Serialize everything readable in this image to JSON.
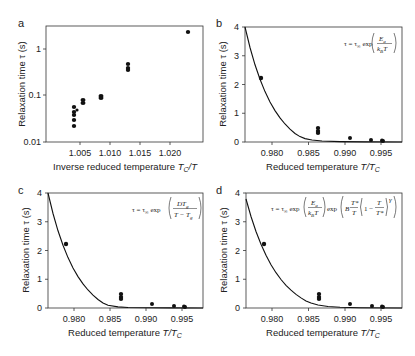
{
  "chart_data": [
    {
      "panel": "a",
      "type": "scatter",
      "title": "",
      "xlabel": "Inverse reduced temperature T_C/T",
      "ylabel": "Relaxation time τ (s)",
      "xscale": "linear",
      "yscale": "log",
      "xlim": [
        1.0017,
        1.0238
      ],
      "ylim": [
        0.01,
        3.2
      ],
      "xticks": [
        "1.005",
        "1.010",
        "1.015",
        "1.020"
      ],
      "yticks": [
        "0.01",
        "0.1",
        "1"
      ],
      "grid": false,
      "series": [
        {
          "name": "data",
          "x": [
            1.0047,
            1.0047,
            1.0047,
            1.0047,
            1.0047,
            1.0062,
            1.0062,
            1.0093,
            1.0093,
            1.0137,
            1.0137,
            1.0137,
            1.022
          ],
          "y": [
            0.055,
            0.043,
            0.037,
            0.029,
            0.022,
            0.078,
            0.07,
            0.15,
            0.14,
            0.47,
            0.38,
            0.35,
            2.3
          ]
        }
      ]
    },
    {
      "panel": "b",
      "type": "scatter",
      "xlabel": "Reduced temperature T/T_C",
      "ylabel": "Relaxation time τ (s)",
      "xlim": [
        0.9763,
        0.9979
      ],
      "ylim": [
        0,
        4
      ],
      "xticks": [
        "0.980",
        "0.985",
        "0.990",
        "0.995"
      ],
      "yticks": [
        "0",
        "1",
        "2",
        "3",
        "4"
      ],
      "grid": false,
      "annotation": "τ = τ∞ exp(E_a / k_B T)",
      "series": [
        {
          "name": "data",
          "x": [
            0.9786,
            0.9865,
            0.9865,
            0.9865,
            0.9908,
            0.9938,
            0.9953,
            0.9953
          ],
          "y": [
            2.2,
            0.45,
            0.38,
            0.32,
            0.14,
            0.07,
            0.05,
            0.03
          ]
        },
        {
          "name": "fit (Arrhenius)",
          "style": "line"
        }
      ]
    },
    {
      "panel": "c",
      "type": "scatter",
      "xlabel": "Reduced temperature T/T_C",
      "ylabel": "Relaxation time τ (s)",
      "xlim": [
        0.9763,
        0.9979
      ],
      "ylim": [
        0,
        4
      ],
      "xticks": [
        "0.980",
        "0.985",
        "0.990",
        "0.995"
      ],
      "yticks": [
        "0",
        "1",
        "2",
        "3",
        "4"
      ],
      "grid": false,
      "annotation": "τ = τ∞ exp(D T_g / (T − T_g))",
      "series": [
        {
          "name": "data",
          "x": [
            0.9786,
            0.9865,
            0.9865,
            0.9865,
            0.9908,
            0.9938,
            0.9953,
            0.9953
          ],
          "y": [
            2.2,
            0.45,
            0.38,
            0.32,
            0.14,
            0.07,
            0.05,
            0.03
          ]
        },
        {
          "name": "fit (VFT)",
          "style": "line"
        }
      ]
    },
    {
      "panel": "d",
      "type": "scatter",
      "xlabel": "Reduced temperature T/T_C",
      "ylabel": "Relaxation time τ (s)",
      "xlim": [
        0.9763,
        0.9979
      ],
      "ylim": [
        0,
        4
      ],
      "xticks": [
        "0.980",
        "0.985",
        "0.990",
        "0.995"
      ],
      "yticks": [
        "0",
        "1",
        "2",
        "3",
        "4"
      ],
      "grid": false,
      "annotation": "τ = τ∞ exp(E_a / k_B T) exp(B (T*/T)(1 − T/T*)^γ)",
      "series": [
        {
          "name": "data",
          "x": [
            0.9786,
            0.9865,
            0.9865,
            0.9865,
            0.9908,
            0.9938,
            0.9953,
            0.9953
          ],
          "y": [
            2.2,
            0.45,
            0.38,
            0.32,
            0.14,
            0.07,
            0.05,
            0.03
          ]
        },
        {
          "name": "fit (frustration-limited)",
          "style": "line"
        }
      ]
    }
  ],
  "labels": {
    "a": "a",
    "b": "b",
    "c": "c",
    "d": "d",
    "ylabel": "Relaxation time τ (s)",
    "xlabel_a_prefix": "Inverse reduced temperature ",
    "xlabel_a_var": "T",
    "xlabel_a_sub": "C",
    "xlabel_a_suffix": "/T",
    "xlabel_bcd_prefix": "Reduced temperature ",
    "xlabel_bcd_var": "T/T",
    "xlabel_bcd_sub": "C"
  },
  "ticks": {
    "a_x": [
      "1.005",
      "1.010",
      "1.015",
      "1.020"
    ],
    "a_y": [
      "0.01",
      "0.1",
      "1"
    ],
    "lin_x": [
      "0.980",
      "0.985",
      "0.990",
      "0.995"
    ],
    "lin_y": [
      "0",
      "1",
      "2",
      "3",
      "4"
    ]
  }
}
